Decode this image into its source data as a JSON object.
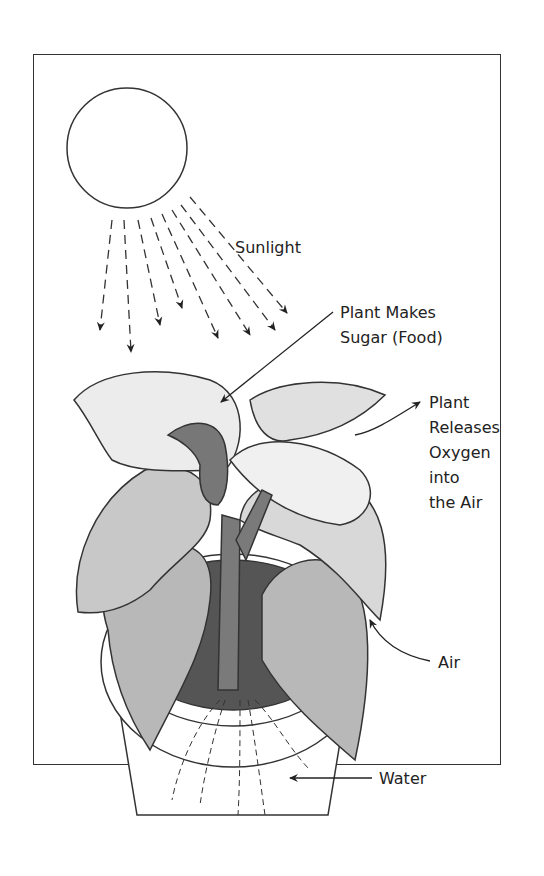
{
  "diagram": {
    "type": "photosynthesis-illustration",
    "labels": {
      "sunlight": "Sunlight",
      "sugar_line1": "Plant Makes",
      "sugar_line2": "Sugar (Food)",
      "oxygen_line1": "Plant",
      "oxygen_line2": "Releases",
      "oxygen_line3": "Oxygen",
      "oxygen_line4": "into",
      "oxygen_line5": "the Air",
      "air": "Air",
      "water": "Water"
    },
    "elements": [
      "sun",
      "sunlight-rays",
      "plant-leaves",
      "stem",
      "pot",
      "soil",
      "roots"
    ],
    "colors": {
      "outline": "#333333",
      "leaf_light": "#f4f4f4",
      "leaf_mid": "#c4c4c4",
      "stem": "#7a7a7a",
      "soil": "#555555",
      "pot": "#ffffff"
    }
  }
}
